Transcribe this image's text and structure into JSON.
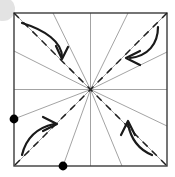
{
  "figure": {
    "canvas": {
      "width": 175,
      "height": 177,
      "background": "#ffffff"
    }
  },
  "chart_data": {
    "type": "diagram",
    "square": {
      "x": 14,
      "y": 13,
      "width": 153,
      "height": 153,
      "stroke": "#3b3b3b",
      "stroke_width": 1.4,
      "fill": "none"
    },
    "center": {
      "x": 90.5,
      "y": 89.5,
      "label": ""
    },
    "radial_lines": {
      "count": 16,
      "stroke": "#8c8c8c",
      "stroke_width": 0.8,
      "note": "Each crease runs from the centre out to a point on the square boundary.",
      "endpoints": [
        {
          "x": 167,
          "y": 89.5
        },
        {
          "x": 167,
          "y": 52
        },
        {
          "x": 167,
          "y": 13
        },
        {
          "x": 128,
          "y": 13
        },
        {
          "x": 90.5,
          "y": 13
        },
        {
          "x": 53,
          "y": 13
        },
        {
          "x": 14,
          "y": 13
        },
        {
          "x": 14,
          "y": 51
        },
        {
          "x": 14,
          "y": 89.5
        },
        {
          "x": 14,
          "y": 119
        },
        {
          "x": 14,
          "y": 166
        },
        {
          "x": 63,
          "y": 166
        },
        {
          "x": 90.5,
          "y": 166
        },
        {
          "x": 122,
          "y": 166
        },
        {
          "x": 167,
          "y": 166
        },
        {
          "x": 167,
          "y": 126
        }
      ]
    },
    "dashed_diagonals": {
      "stroke": "#1f1f1f",
      "stroke_width": 1.5,
      "dash_pattern": "7 6",
      "lines": [
        {
          "name": "main-diagonal",
          "x1": 14,
          "y1": 13,
          "x2": 167,
          "y2": 166
        },
        {
          "name": "anti-diagonal",
          "x1": 167,
          "y1": 13,
          "x2": 14,
          "y2": 166
        }
      ]
    },
    "edge_markers": {
      "radius": 4.4,
      "fill": "#000000",
      "points": [
        {
          "name": "left-edge-marker",
          "x": 14,
          "y": 119
        },
        {
          "name": "bottom-edge-marker",
          "x": 63,
          "y": 166
        }
      ]
    },
    "fold_arrows": {
      "stroke": "#1a1a1a",
      "stroke_width": 2.2,
      "items": [
        {
          "name": "top-left-fold-arrow",
          "corner": "top-left",
          "direction": "clockwise, sweeping down-right",
          "path": "M 22 23 C 45 30, 62 42, 62 57",
          "head": "M 56 46 L 62 59 L 68 47"
        },
        {
          "name": "top-right-fold-arrow",
          "corner": "top-right",
          "direction": "sweeping down-left",
          "path": "M 158 27 C 158 44, 148 56, 130 58",
          "head": "M 140 51 L 126 58 L 140 65"
        },
        {
          "name": "bottom-left-fold-arrow",
          "corner": "bottom-left",
          "direction": "sweeping up-right",
          "path": "M 22 155 C 26 138, 36 128, 54 124",
          "head": "M 43 117 L 57 124 L 43 131"
        },
        {
          "name": "bottom-right-fold-arrow",
          "corner": "bottom-right",
          "direction": "sweeping up-left",
          "path": "M 152 155 C 140 150, 131 140, 128 124",
          "head": "M 121 135 L 128 121 L 135 135"
        }
      ]
    },
    "corner_decoration": {
      "name": "top-left-gray-disc",
      "shape": "circle",
      "cx": 3,
      "cy": 9,
      "r": 12,
      "fill": "#e3e3e3",
      "note": "Pale gray disc partially cropped by the image edge."
    }
  }
}
